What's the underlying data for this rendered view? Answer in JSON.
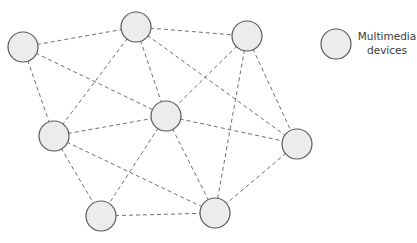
{
  "diagram": {
    "type": "network",
    "node_radius": 15,
    "colors": {
      "node_fill": "#ececec",
      "node_stroke": "#5a5a5a",
      "edge": "#707070"
    },
    "nodes": [
      {
        "id": "n1",
        "x": 23,
        "y": 47
      },
      {
        "id": "n2",
        "x": 136,
        "y": 27
      },
      {
        "id": "n3",
        "x": 247,
        "y": 36
      },
      {
        "id": "n4",
        "x": 54,
        "y": 136
      },
      {
        "id": "n5",
        "x": 166,
        "y": 116
      },
      {
        "id": "n6",
        "x": 297,
        "y": 144
      },
      {
        "id": "n7",
        "x": 101,
        "y": 216
      },
      {
        "id": "n8",
        "x": 215,
        "y": 213
      }
    ],
    "edges": [
      [
        "n1",
        "n2"
      ],
      [
        "n1",
        "n4"
      ],
      [
        "n1",
        "n5"
      ],
      [
        "n2",
        "n3"
      ],
      [
        "n2",
        "n4"
      ],
      [
        "n2",
        "n5"
      ],
      [
        "n2",
        "n6"
      ],
      [
        "n3",
        "n5"
      ],
      [
        "n3",
        "n6"
      ],
      [
        "n3",
        "n8"
      ],
      [
        "n4",
        "n5"
      ],
      [
        "n4",
        "n7"
      ],
      [
        "n4",
        "n8"
      ],
      [
        "n5",
        "n6"
      ],
      [
        "n5",
        "n7"
      ],
      [
        "n5",
        "n8"
      ],
      [
        "n6",
        "n8"
      ],
      [
        "n7",
        "n8"
      ]
    ],
    "legend": {
      "symbol": {
        "x": 336,
        "y": 44
      },
      "label_line1": "Multimedia",
      "label_line2": "devices"
    }
  }
}
